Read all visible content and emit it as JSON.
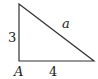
{
  "diagram": {
    "type": "right-triangle",
    "vertices": {
      "top": [
        19,
        4
      ],
      "right_angle": [
        19,
        61
      ],
      "right": [
        94,
        61
      ]
    },
    "labels": {
      "vertical_side": "3",
      "horizontal_side": "4",
      "hypotenuse": "a",
      "vertex": "A"
    },
    "stroke_color": "#333333"
  }
}
